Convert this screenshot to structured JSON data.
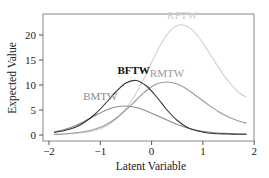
{
  "chart_data": {
    "type": "line",
    "title": "",
    "xlabel": "Latent Variable",
    "ylabel": "Expected Value",
    "xlim": [
      -2,
      2
    ],
    "ylim": [
      -0.8,
      24
    ],
    "xticks": [
      -2,
      -1,
      0,
      1,
      2
    ],
    "yticks": [
      0,
      5,
      10,
      15,
      20
    ],
    "xtick_labels": [
      "−2",
      "−1",
      "0",
      "1",
      "2"
    ],
    "ytick_labels": [
      "0",
      "5",
      "10",
      "15",
      "20"
    ],
    "grid": false,
    "legend": "inline labels",
    "x": [
      -1.9,
      -1.7,
      -1.5,
      -1.3,
      -1.1,
      -0.9,
      -0.7,
      -0.5,
      -0.3,
      -0.1,
      0.1,
      0.3,
      0.5,
      0.7,
      0.9,
      1.1,
      1.3,
      1.5,
      1.7,
      1.85
    ],
    "series": [
      {
        "name": "BFTW",
        "color": "#333333",
        "label_at": [
          -0.35,
          12.3
        ],
        "values": [
          0.5,
          0.9,
          1.5,
          2.6,
          4.2,
          6.3,
          8.6,
          10.4,
          10.9,
          9.8,
          7.6,
          5.0,
          2.9,
          1.5,
          0.8,
          0.4,
          0.25,
          0.2,
          0.15,
          0.15
        ]
      },
      {
        "name": "BMTW",
        "color": "#8c8c8c",
        "label_at": [
          -1.0,
          7.0
        ],
        "values": [
          0.6,
          1.1,
          1.8,
          2.8,
          3.9,
          4.9,
          5.6,
          5.8,
          5.5,
          4.8,
          3.9,
          3.0,
          2.1,
          1.4,
          0.9,
          0.6,
          0.4,
          0.3,
          0.2,
          0.2
        ]
      },
      {
        "name": "RMTW",
        "color": "#9a9a9a",
        "label_at": [
          0.3,
          11.7
        ],
        "values": [
          0.1,
          0.2,
          0.4,
          0.7,
          1.2,
          2.0,
          3.3,
          5.0,
          7.0,
          8.9,
          10.2,
          10.6,
          10.2,
          9.1,
          7.6,
          6.1,
          4.7,
          3.6,
          2.8,
          2.4
        ]
      },
      {
        "name": "RFTW",
        "color": "#cfcfcf",
        "label_at": [
          0.6,
          23.3
        ],
        "values": [
          0.1,
          0.2,
          0.3,
          0.5,
          0.9,
          1.7,
          3.1,
          5.3,
          8.4,
          12.3,
          16.6,
          20.1,
          21.9,
          21.7,
          19.8,
          16.8,
          13.6,
          10.7,
          8.5,
          7.6
        ]
      }
    ]
  }
}
